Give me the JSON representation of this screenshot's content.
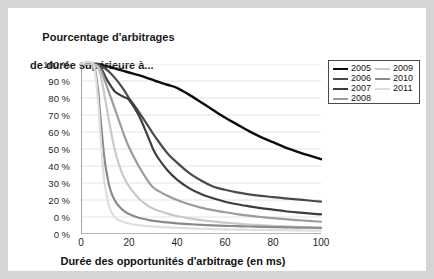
{
  "chart_data": {
    "type": "line",
    "title": "Pourcentage d'arbitrages de durée supérieure à...",
    "title_line1": "Pourcentage d'arbitrages",
    "title_line2": "de durée supérieure à...",
    "xlabel": "Durée des opportunités d'arbitrage (en ms)",
    "ylabel": "",
    "xlim": [
      0,
      100
    ],
    "ylim": [
      0,
      100
    ],
    "xticks": [
      "0",
      "20",
      "40",
      "60",
      "80",
      "100"
    ],
    "xtick_values": [
      0,
      20,
      40,
      60,
      80,
      100
    ],
    "yticks": [
      "100 %",
      "90 %",
      "80 %",
      "70 %",
      "60 %",
      "50 %",
      "40 %",
      "30 %",
      "20 %",
      "0 %",
      "0 %"
    ],
    "ytick_values": [
      100,
      90,
      80,
      70,
      60,
      50,
      40,
      30,
      20,
      10,
      0
    ],
    "grid": "horizontal",
    "legend_position": "top-right",
    "x": [
      0,
      5,
      7,
      8,
      9,
      10,
      12,
      14,
      16,
      18,
      20,
      24,
      28,
      30,
      32,
      36,
      40,
      45,
      50,
      55,
      60,
      65,
      70,
      75,
      80,
      85,
      90,
      95,
      100
    ],
    "series": [
      {
        "name": "2005",
        "color": "#0d0d0d",
        "width": 2.4,
        "values": [
          100,
          100,
          100,
          99.6,
          99.3,
          99,
          98.2,
          97.4,
          96.6,
          95.8,
          95,
          93.4,
          91.6,
          90.6,
          89.6,
          87.8,
          86,
          82,
          77.5,
          73,
          68.5,
          64.5,
          60.5,
          57,
          54,
          51,
          48.5,
          46.2,
          44
        ]
      },
      {
        "name": "2006",
        "color": "#4a4a4a",
        "width": 2.2,
        "values": [
          100,
          100,
          100,
          99,
          98.2,
          97.5,
          95,
          92,
          88.5,
          84.5,
          80,
          72,
          63.5,
          59,
          55,
          47.5,
          42,
          36,
          31.5,
          28,
          26,
          24.5,
          23.3,
          22.4,
          21.7,
          21,
          20.4,
          19.7,
          19
        ]
      },
      {
        "name": "2007",
        "color": "#3d3d3d",
        "width": 2.2,
        "values": [
          100,
          100,
          99.5,
          98,
          96,
          93,
          88,
          84,
          82,
          80.5,
          79,
          70,
          57,
          50,
          45,
          37.5,
          32,
          27,
          23.5,
          21,
          19,
          17.5,
          16.3,
          15.2,
          14.3,
          13.4,
          12.7,
          12.1,
          11.5
        ]
      },
      {
        "name": "2008",
        "color": "#9b9b9b",
        "width": 2.2,
        "values": [
          100,
          100,
          99,
          97,
          94,
          90,
          82,
          74,
          66,
          58,
          51,
          40,
          31,
          27.5,
          25.5,
          22.5,
          20,
          17.5,
          15.5,
          14,
          12.8,
          11.7,
          10.8,
          10,
          9.3,
          8.7,
          8.2,
          7.7,
          7.2
        ]
      },
      {
        "name": "2009",
        "color": "#c9c9c9",
        "width": 2.2,
        "values": [
          100,
          100,
          98,
          94,
          88,
          80,
          64,
          50,
          40,
          33,
          28,
          21,
          16.5,
          15,
          13.8,
          12,
          10.6,
          9.2,
          8.2,
          7.4,
          6.7,
          6.1,
          5.6,
          5.2,
          4.8,
          4.5,
          4.2,
          3.9,
          3.6
        ]
      },
      {
        "name": "2010",
        "color": "#8a8a8a",
        "width": 2.2,
        "values": [
          100,
          100,
          86,
          70,
          55,
          42,
          27,
          20,
          16,
          13.5,
          11.8,
          9.6,
          8.3,
          7.8,
          7.4,
          6.8,
          6.3,
          5.8,
          5.4,
          5.1,
          4.8,
          4.6,
          4.4,
          4.2,
          4.1,
          3.9,
          3.8,
          3.7,
          3.6
        ]
      },
      {
        "name": "2011",
        "color": "#dedede",
        "width": 2.2,
        "values": [
          100,
          100,
          80,
          60,
          42,
          28,
          15,
          10,
          8,
          7,
          6.2,
          5.2,
          4.6,
          4.4,
          4.2,
          3.9,
          3.6,
          3.3,
          3.1,
          2.9,
          2.7,
          2.6,
          2.5,
          2.4,
          2.3,
          2.2,
          2.1,
          2.05,
          2
        ]
      }
    ],
    "legend": {
      "columns": [
        [
          {
            "label": "2005",
            "color": "#0d0d0d",
            "width": 2.6
          },
          {
            "label": "2006",
            "color": "#4a4a4a",
            "width": 2.2
          },
          {
            "label": "2007",
            "color": "#3d3d3d",
            "width": 2.2
          },
          {
            "label": "2008",
            "color": "#9b9b9b",
            "width": 2.2
          }
        ],
        [
          {
            "label": "2009",
            "color": "#c9c9c9",
            "width": 2.2
          },
          {
            "label": "2010",
            "color": "#8a8a8a",
            "width": 2.2
          },
          {
            "label": "2011",
            "color": "#dedede",
            "width": 2.2
          }
        ]
      ]
    },
    "colors": {
      "background": "#ffffff",
      "outer_background": "#d5d5d5",
      "grid": "#e3e3e3",
      "axis": "#6e6e6e",
      "text": "#1a1a1a"
    }
  }
}
